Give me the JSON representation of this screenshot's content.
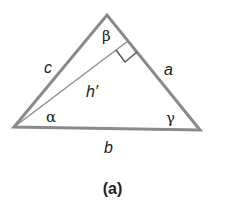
{
  "figure": {
    "caption": "(a)",
    "colors": {
      "stroke": "#8a8a8a",
      "text": "#222222",
      "background": "#ffffff"
    },
    "vertices": {
      "left": [
        14,
        127
      ],
      "top": [
        107,
        15
      ],
      "right": [
        200,
        130
      ]
    },
    "altitude_foot": [
      128,
      41
    ],
    "labels": {
      "side_c": "c",
      "side_a": "a",
      "side_b": "b",
      "altitude": "h′",
      "angle_alpha": "α",
      "angle_beta": "β",
      "angle_gamma": "γ"
    }
  }
}
